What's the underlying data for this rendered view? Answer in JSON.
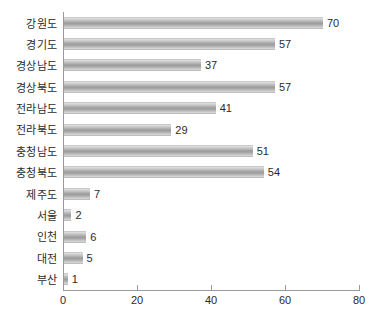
{
  "chart_data": {
    "type": "bar",
    "orientation": "horizontal",
    "title": "",
    "xlabel": "",
    "ylabel": "",
    "xlim": [
      0,
      80
    ],
    "xticks": [
      0,
      20,
      40,
      60,
      80
    ],
    "grid": false,
    "legend": false,
    "show_value_labels": true,
    "bar_color": "#a8a8a8",
    "axis_color": "#9a9a9a",
    "text_color": "#2b2b2b",
    "categories": [
      "강원도",
      "경기도",
      "경상남도",
      "경상북도",
      "전라남도",
      "전라북도",
      "충청남도",
      "충청북도",
      "제주도",
      "서울",
      "인천",
      "대전",
      "부산"
    ],
    "values": [
      70,
      57,
      37,
      57,
      41,
      29,
      51,
      54,
      7,
      2,
      6,
      5,
      1
    ]
  }
}
